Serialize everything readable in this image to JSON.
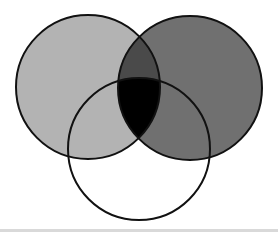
{
  "diagram": {
    "type": "venn",
    "sets": 3,
    "stroke_color": "#111111",
    "stroke_width": 2,
    "background": "#ffffff",
    "circles": [
      {
        "id": "left",
        "cx": 88,
        "cy": 87,
        "r": 72,
        "fill": "#b3b3b3"
      },
      {
        "id": "right",
        "cx": 190,
        "cy": 88,
        "r": 72,
        "fill": "#707070"
      },
      {
        "id": "bottom",
        "cx": 139,
        "cy": 149,
        "r": 71,
        "fill": "#ffffff"
      }
    ],
    "regions": {
      "left_only": "#b3b3b3",
      "right_only": "#707070",
      "bottom_only": "#ffffff",
      "left_right": "#4a4a4a",
      "left_bottom": "#b3b3b3",
      "right_bottom": "#707070",
      "all_three": "#000000"
    },
    "labels": []
  },
  "footer": {
    "rule_color": "#d9d9d9"
  }
}
